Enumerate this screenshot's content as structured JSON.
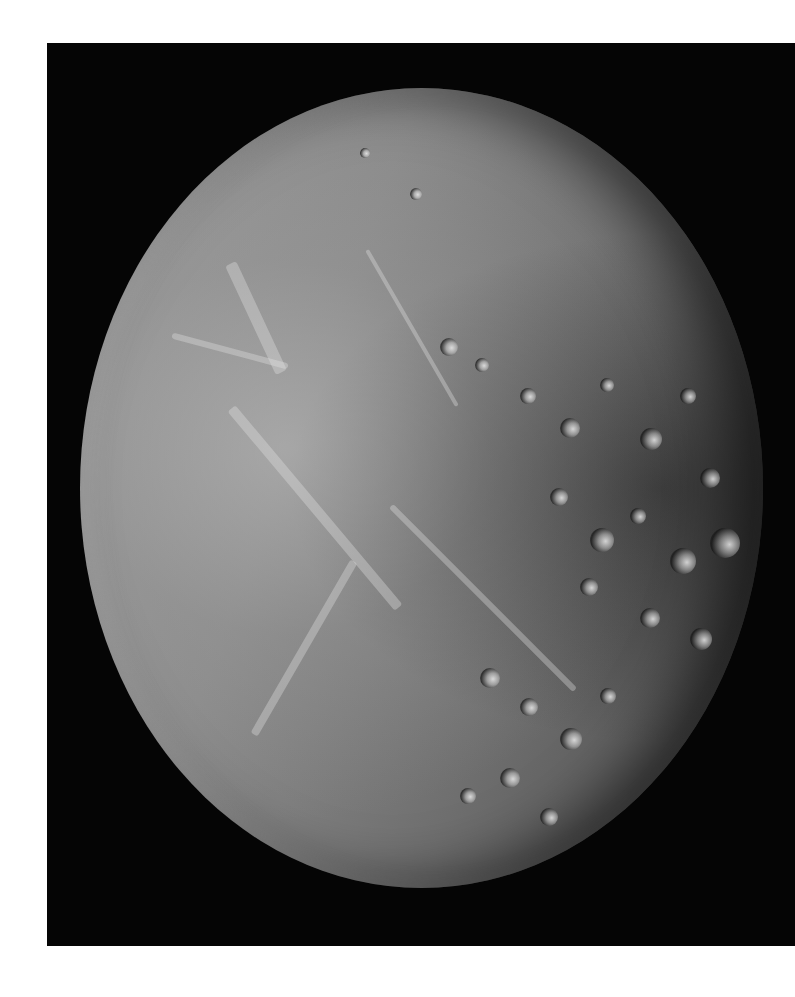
{
  "image": {
    "subject": "Cratered icy moon in grayscale",
    "alt": "Grayscale photograph of a heavily cratered, grooved icy moon against a black background",
    "background_color": "#ffffff",
    "frame_color": "#050505",
    "surface_colors": {
      "lit": "#b5b5b5",
      "mid": "#8a8a8a",
      "shadow": "#3a3a3a"
    }
  }
}
